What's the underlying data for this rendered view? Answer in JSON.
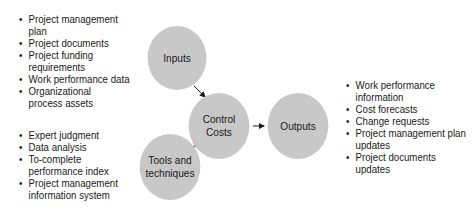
{
  "diagram": {
    "nodes": {
      "inputs": {
        "label": "Inputs"
      },
      "control": {
        "line1": "Control",
        "line2": "Costs"
      },
      "outputs": {
        "label": "Outputs"
      },
      "tools": {
        "line1": "Tools and",
        "line2": "techniques"
      }
    },
    "inputs_list": [
      "Project management plan",
      "Project documents",
      "Project funding requirements",
      "Work performance data",
      "Organizational process assets"
    ],
    "tools_list": [
      "Expert judgment",
      "Data analysis",
      "To-complete performance index",
      "Project management information system"
    ],
    "outputs_list": [
      "Work performance information",
      "Cost forecasts",
      "Change requests",
      "Project management plan updates",
      "Project documents updates"
    ],
    "colors": {
      "circle": "#c8c8c8",
      "arrow": "#1a1a1a"
    }
  }
}
